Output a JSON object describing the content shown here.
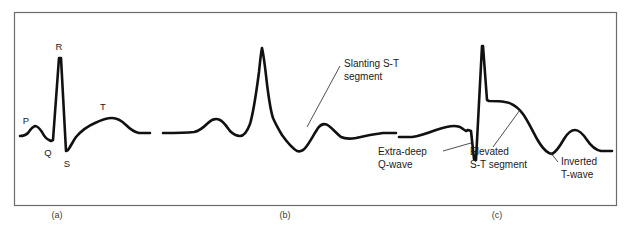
{
  "figure": {
    "background_color": "#ffffff",
    "frame_color": "#6b6b6b",
    "trace_color": "#111111",
    "leader_color": "#3b3b3b"
  },
  "panels": [
    {
      "id": "a",
      "caption": "(a)",
      "description": "Normal ECG complex",
      "wave_labels": [
        {
          "name": "p-wave-label",
          "text": "P"
        },
        {
          "name": "q-wave-label",
          "text": "Q"
        },
        {
          "name": "r-wave-label",
          "text": "R"
        },
        {
          "name": "s-wave-label",
          "text": "S"
        },
        {
          "name": "t-wave-label",
          "text": "T"
        }
      ],
      "annotations": []
    },
    {
      "id": "b",
      "caption": "(b)",
      "description": "ECG with slanting S-T segment",
      "wave_labels": [],
      "annotations": [
        {
          "name": "slanting-st-segment-annotation",
          "line1": "Slanting S-T",
          "line2": "segment"
        }
      ]
    },
    {
      "id": "c",
      "caption": "(c)",
      "description": "ECG with extra-deep Q-wave, elevated S-T segment and inverted T-wave",
      "wave_labels": [],
      "annotations": [
        {
          "name": "extra-deep-q-wave-annotation",
          "line1": "Extra-deep",
          "line2": "Q-wave"
        },
        {
          "name": "elevated-st-segment-annotation",
          "line1": "Elevated",
          "line2": "S-T segment"
        },
        {
          "name": "inverted-t-wave-annotation",
          "line1": "Inverted",
          "line2": "T-wave"
        }
      ]
    }
  ]
}
